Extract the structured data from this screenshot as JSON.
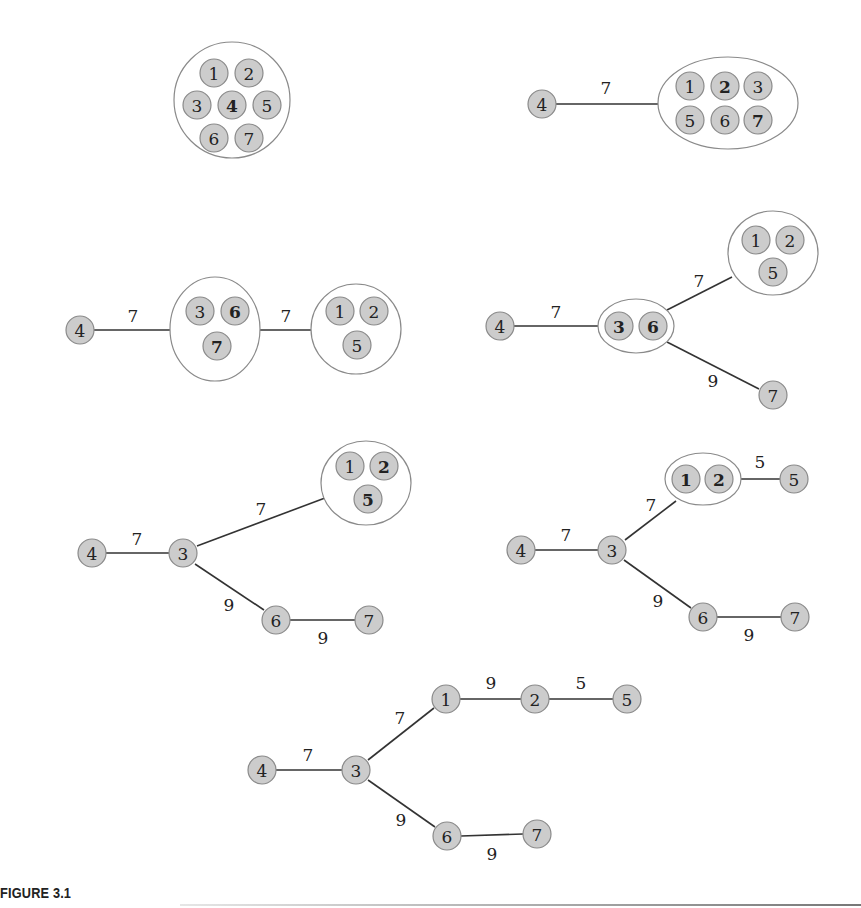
{
  "caption": "FIGURE 3.1",
  "panels": [
    {
      "id": "panel-1",
      "groups": [
        {
          "cx": 232,
          "cy": 100,
          "rx": 58,
          "ry": 58
        }
      ],
      "nodes": [
        {
          "label": "1",
          "x": 214,
          "y": 73,
          "bold": false
        },
        {
          "label": "2",
          "x": 249,
          "y": 73,
          "bold": false
        },
        {
          "label": "3",
          "x": 197,
          "y": 105,
          "bold": false
        },
        {
          "label": "4",
          "x": 232,
          "y": 105,
          "bold": true
        },
        {
          "label": "5",
          "x": 267,
          "y": 105,
          "bold": false
        },
        {
          "label": "6",
          "x": 214,
          "y": 138,
          "bold": false
        },
        {
          "label": "7",
          "x": 249,
          "y": 138,
          "bold": false
        }
      ],
      "edges": []
    },
    {
      "id": "panel-2",
      "groups": [
        {
          "cx": 728,
          "cy": 103,
          "rx": 70,
          "ry": 46
        }
      ],
      "nodes": [
        {
          "label": "4",
          "x": 542,
          "y": 104,
          "bold": false
        },
        {
          "label": "1",
          "x": 690,
          "y": 86,
          "bold": false
        },
        {
          "label": "2",
          "x": 725,
          "y": 86,
          "bold": true
        },
        {
          "label": "3",
          "x": 758,
          "y": 86,
          "bold": false
        },
        {
          "label": "5",
          "x": 690,
          "y": 120,
          "bold": false
        },
        {
          "label": "6",
          "x": 725,
          "y": 120,
          "bold": false
        },
        {
          "label": "7",
          "x": 758,
          "y": 120,
          "bold": true
        }
      ],
      "edges": [
        {
          "x1": 556,
          "y1": 104,
          "x2": 658,
          "y2": 104,
          "weight": "7",
          "wx": 606,
          "wy": 94
        }
      ]
    },
    {
      "id": "panel-3",
      "groups": [
        {
          "cx": 215,
          "cy": 329,
          "rx": 45,
          "ry": 52
        },
        {
          "cx": 356,
          "cy": 329,
          "rx": 45,
          "ry": 45
        }
      ],
      "nodes": [
        {
          "label": "4",
          "x": 80,
          "y": 330,
          "bold": false
        },
        {
          "label": "3",
          "x": 200,
          "y": 311,
          "bold": false
        },
        {
          "label": "6",
          "x": 235,
          "y": 311,
          "bold": true
        },
        {
          "label": "7",
          "x": 217,
          "y": 346,
          "bold": true
        },
        {
          "label": "1",
          "x": 340,
          "y": 311,
          "bold": false
        },
        {
          "label": "2",
          "x": 374,
          "y": 311,
          "bold": false
        },
        {
          "label": "5",
          "x": 357,
          "y": 345,
          "bold": false
        }
      ],
      "edges": [
        {
          "x1": 94,
          "y1": 330,
          "x2": 170,
          "y2": 330,
          "weight": "7",
          "wx": 133,
          "wy": 322
        },
        {
          "x1": 260,
          "y1": 330,
          "x2": 311,
          "y2": 330,
          "weight": "7",
          "wx": 286,
          "wy": 322
        }
      ]
    },
    {
      "id": "panel-4",
      "groups": [
        {
          "cx": 636,
          "cy": 326,
          "rx": 38,
          "ry": 27
        },
        {
          "cx": 773,
          "cy": 253,
          "rx": 45,
          "ry": 42
        }
      ],
      "nodes": [
        {
          "label": "4",
          "x": 500,
          "y": 326,
          "bold": false
        },
        {
          "label": "3",
          "x": 619,
          "y": 326,
          "bold": true
        },
        {
          "label": "6",
          "x": 653,
          "y": 326,
          "bold": true
        },
        {
          "label": "1",
          "x": 756,
          "y": 240,
          "bold": false
        },
        {
          "label": "2",
          "x": 790,
          "y": 240,
          "bold": false
        },
        {
          "label": "5",
          "x": 773,
          "y": 272,
          "bold": false
        },
        {
          "label": "7",
          "x": 773,
          "y": 395,
          "bold": false
        }
      ],
      "edges": [
        {
          "x1": 514,
          "y1": 326,
          "x2": 598,
          "y2": 326,
          "weight": "7",
          "wx": 556,
          "wy": 318
        },
        {
          "x1": 667,
          "y1": 310,
          "x2": 732,
          "y2": 277,
          "weight": "7",
          "wx": 699,
          "wy": 287
        },
        {
          "x1": 667,
          "y1": 342,
          "x2": 759,
          "y2": 389,
          "weight": "9",
          "wx": 713,
          "wy": 387
        }
      ]
    },
    {
      "id": "panel-5",
      "groups": [
        {
          "cx": 366,
          "cy": 483,
          "rx": 45,
          "ry": 42
        }
      ],
      "nodes": [
        {
          "label": "4",
          "x": 92,
          "y": 553,
          "bold": false
        },
        {
          "label": "3",
          "x": 183,
          "y": 553,
          "bold": false
        },
        {
          "label": "1",
          "x": 350,
          "y": 466,
          "bold": false
        },
        {
          "label": "2",
          "x": 384,
          "y": 466,
          "bold": true
        },
        {
          "label": "5",
          "x": 368,
          "y": 499,
          "bold": true
        },
        {
          "label": "6",
          "x": 276,
          "y": 620,
          "bold": false
        },
        {
          "label": "7",
          "x": 369,
          "y": 620,
          "bold": false
        }
      ],
      "edges": [
        {
          "x1": 106,
          "y1": 553,
          "x2": 169,
          "y2": 553,
          "weight": "7",
          "wx": 137,
          "wy": 545
        },
        {
          "x1": 197,
          "y1": 546,
          "x2": 325,
          "y2": 498,
          "weight": "7",
          "wx": 261,
          "wy": 515
        },
        {
          "x1": 195,
          "y1": 564,
          "x2": 264,
          "y2": 610,
          "weight": "9",
          "wx": 229,
          "wy": 611
        },
        {
          "x1": 290,
          "y1": 620,
          "x2": 355,
          "y2": 620,
          "weight": "9",
          "wx": 323,
          "wy": 644
        }
      ]
    },
    {
      "id": "panel-6",
      "groups": [
        {
          "cx": 703,
          "cy": 479,
          "rx": 38,
          "ry": 26
        }
      ],
      "nodes": [
        {
          "label": "4",
          "x": 521,
          "y": 550,
          "bold": false
        },
        {
          "label": "3",
          "x": 612,
          "y": 550,
          "bold": false
        },
        {
          "label": "1",
          "x": 686,
          "y": 479,
          "bold": true
        },
        {
          "label": "2",
          "x": 719,
          "y": 479,
          "bold": true
        },
        {
          "label": "5",
          "x": 794,
          "y": 479,
          "bold": false
        },
        {
          "label": "6",
          "x": 703,
          "y": 617,
          "bold": false
        },
        {
          "label": "7",
          "x": 795,
          "y": 617,
          "bold": false
        }
      ],
      "edges": [
        {
          "x1": 535,
          "y1": 550,
          "x2": 598,
          "y2": 550,
          "weight": "7",
          "wx": 566,
          "wy": 541
        },
        {
          "x1": 625,
          "y1": 540,
          "x2": 676,
          "y2": 501,
          "weight": "7",
          "wx": 651,
          "wy": 511
        },
        {
          "x1": 741,
          "y1": 479,
          "x2": 780,
          "y2": 479,
          "weight": "5",
          "wx": 760,
          "wy": 468
        },
        {
          "x1": 624,
          "y1": 560,
          "x2": 691,
          "y2": 608,
          "weight": "9",
          "wx": 658,
          "wy": 607
        },
        {
          "x1": 717,
          "y1": 617,
          "x2": 781,
          "y2": 617,
          "weight": "9",
          "wx": 749,
          "wy": 641
        }
      ]
    },
    {
      "id": "panel-7",
      "groups": [],
      "nodes": [
        {
          "label": "4",
          "x": 262,
          "y": 770,
          "bold": false
        },
        {
          "label": "3",
          "x": 356,
          "y": 770,
          "bold": false
        },
        {
          "label": "1",
          "x": 446,
          "y": 699,
          "bold": false
        },
        {
          "label": "2",
          "x": 535,
          "y": 699,
          "bold": false
        },
        {
          "label": "5",
          "x": 627,
          "y": 699,
          "bold": false
        },
        {
          "label": "6",
          "x": 447,
          "y": 836,
          "bold": false
        },
        {
          "label": "7",
          "x": 537,
          "y": 834,
          "bold": false
        }
      ],
      "edges": [
        {
          "x1": 276,
          "y1": 770,
          "x2": 342,
          "y2": 770,
          "weight": "7",
          "wx": 308,
          "wy": 761
        },
        {
          "x1": 368,
          "y1": 760,
          "x2": 434,
          "y2": 708,
          "weight": "7",
          "wx": 400,
          "wy": 724
        },
        {
          "x1": 460,
          "y1": 699,
          "x2": 521,
          "y2": 699,
          "weight": "9",
          "wx": 491,
          "wy": 689
        },
        {
          "x1": 549,
          "y1": 699,
          "x2": 613,
          "y2": 699,
          "weight": "5",
          "wx": 581,
          "wy": 689
        },
        {
          "x1": 368,
          "y1": 780,
          "x2": 435,
          "y2": 827,
          "weight": "9",
          "wx": 401,
          "wy": 826
        },
        {
          "x1": 461,
          "y1": 836,
          "x2": 523,
          "y2": 834,
          "weight": "9",
          "wx": 492,
          "wy": 860
        }
      ]
    }
  ],
  "node_radius": 14,
  "colors": {
    "node_fill": "#cccccc",
    "node_stroke": "#8a8a8a",
    "edge": "#333333",
    "text": "#222222"
  }
}
